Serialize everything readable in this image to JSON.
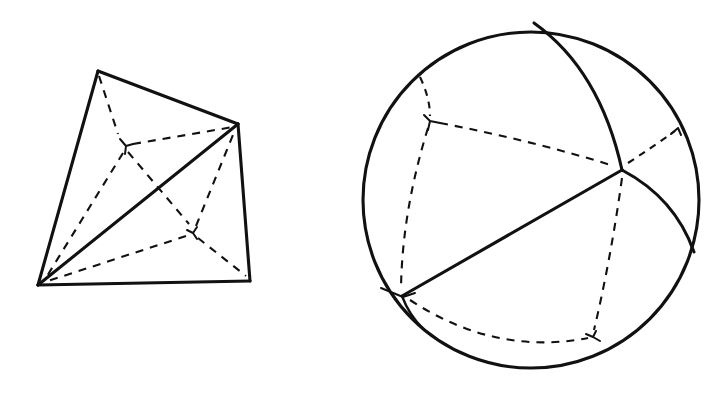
{
  "figure": {
    "background_color": "#ffffff",
    "ink_color": "#111111",
    "width": 727,
    "height": 395,
    "caption": "",
    "panels": [
      {
        "id": "tetrahedron",
        "name": "Tetrahedron with interior dual tree",
        "label": ""
      },
      {
        "id": "spherical-tetrahedron",
        "name": "Sphere with geodesic tetrahedral net",
        "label": ""
      }
    ]
  },
  "tetrahedron": {
    "name": "tetrahedron",
    "stroke_color": "#111111",
    "vertices": {
      "apex_top": [
        98,
        71
      ],
      "right": [
        238,
        124
      ],
      "bottom_left": [
        38,
        285
      ],
      "bottom_right": [
        250,
        281
      ]
    },
    "interior_nodes": {
      "upper_node": [
        126,
        145
      ],
      "lower_node": [
        193,
        232
      ]
    },
    "visible_edges": [
      {
        "name": "apex-to-right",
        "from": [
          98,
          71
        ],
        "to": [
          238,
          124
        ]
      },
      {
        "name": "apex-to-bottom-left",
        "from": [
          98,
          71
        ],
        "to": [
          38,
          285
        ]
      },
      {
        "name": "right-to-bottom-right",
        "from": [
          238,
          124
        ],
        "to": [
          250,
          281
        ]
      },
      {
        "name": "bottom-left-to-bottom-right",
        "from": [
          38,
          285
        ],
        "to": [
          250,
          281
        ]
      },
      {
        "name": "diagonal-bottom-left-to-right",
        "from": [
          38,
          285
        ],
        "to": [
          238,
          124
        ]
      }
    ],
    "hidden_edges": [
      {
        "name": "apex-to-upper-node",
        "from": [
          98,
          71
        ],
        "to": [
          126,
          145
        ]
      },
      {
        "name": "upper-node-to-right",
        "from": [
          126,
          145
        ],
        "to": [
          238,
          124
        ]
      },
      {
        "name": "upper-node-to-bottom-left",
        "from": [
          126,
          145
        ],
        "to": [
          38,
          285
        ]
      },
      {
        "name": "upper-node-to-lower-node",
        "from": [
          126,
          145
        ],
        "to": [
          193,
          232
        ]
      },
      {
        "name": "lower-node-to-right",
        "from": [
          193,
          232
        ],
        "to": [
          238,
          124
        ]
      },
      {
        "name": "lower-node-to-bottom-left",
        "from": [
          193,
          232
        ],
        "to": [
          38,
          285
        ]
      },
      {
        "name": "lower-node-to-bottom-right",
        "from": [
          193,
          232
        ],
        "to": [
          250,
          281
        ]
      }
    ]
  },
  "sphere": {
    "name": "spherical tetrahedron",
    "stroke_color": "#111111",
    "outline": {
      "cx": 531,
      "cy": 200,
      "r": 168
    },
    "nodes": {
      "top_node": [
        535,
        23
      ],
      "center_node": [
        622,
        170
      ],
      "lower_left_node": [
        402,
        296
      ],
      "hidden_upper_left_node": [
        430,
        120
      ],
      "hidden_right_node": [
        677,
        128
      ],
      "hidden_bottom_node": [
        593,
        337
      ]
    },
    "visible_arcs": [
      {
        "name": "meridian-top-to-center",
        "from": [
          535,
          23
        ],
        "to": [
          622,
          170
        ]
      },
      {
        "name": "arc-center-to-lower-left",
        "from": [
          622,
          170
        ],
        "to": [
          402,
          296
        ]
      },
      {
        "name": "arc-center-to-bottom-right-rim",
        "from": [
          622,
          170
        ],
        "to": [
          692,
          252
        ]
      },
      {
        "name": "rim-arc-lower-left",
        "from": [
          402,
          296
        ],
        "to": [
          430,
          330
        ]
      }
    ],
    "hidden_arcs": [
      {
        "name": "arc-top-rim-to-upper-left-node",
        "from": [
          427,
          75
        ],
        "to": [
          430,
          120
        ]
      },
      {
        "name": "arc-upper-left-node-to-center",
        "from": [
          430,
          120
        ],
        "to": [
          622,
          170
        ]
      },
      {
        "name": "arc-upper-left-node-to-lower-left",
        "from": [
          430,
          120
        ],
        "to": [
          402,
          296
        ]
      },
      {
        "name": "arc-center-to-right-rim-node",
        "from": [
          622,
          170
        ],
        "to": [
          677,
          128
        ]
      },
      {
        "name": "arc-center-to-bottom-node",
        "from": [
          622,
          170
        ],
        "to": [
          593,
          337
        ]
      },
      {
        "name": "arc-lower-left-to-bottom-node",
        "from": [
          402,
          296
        ],
        "to": [
          593,
          337
        ]
      }
    ]
  }
}
